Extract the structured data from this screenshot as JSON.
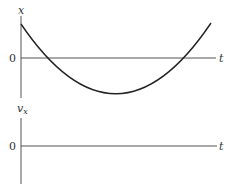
{
  "top_graph": {
    "y_axis_label": "x",
    "x_axis_label": "t",
    "origin_label": "0",
    "curve": "parabola opening upward: starts above axis, dips below, rises above"
  },
  "bottom_graph": {
    "y_axis_label": "v",
    "y_axis_subscript": "x",
    "x_axis_label": "t",
    "origin_label": "0"
  },
  "colors": {
    "axis": "#555555",
    "curve": "#222222",
    "text": "#333333"
  }
}
